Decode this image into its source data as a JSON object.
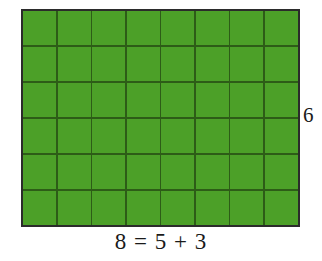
{
  "figure": {
    "title": "",
    "background_color": "#ffffff"
  },
  "grid": {
    "columns": 8,
    "rows": 6,
    "total_cells": 48,
    "fill_color": "#4ca028",
    "gridline_color": "#2d5c17",
    "border_color": "#2b2b2b"
  },
  "labels": {
    "height": "6",
    "equation": "8 = 5 + 3"
  },
  "chart_data": {
    "type": "table",
    "title": "",
    "subtitle": "",
    "xlabel": "8 = 5 + 3",
    "ylabel": "6",
    "columns": 8,
    "rows": 6,
    "area": 48,
    "decomposition": {
      "width_total": 8,
      "width_parts": [
        5,
        3
      ],
      "height": 6
    },
    "categories": [
      "c1",
      "c2",
      "c3",
      "c4",
      "c5",
      "c6",
      "c7",
      "c8"
    ],
    "values": [
      6,
      6,
      6,
      6,
      6,
      6,
      6,
      6
    ],
    "annotations": [
      "6",
      "8 = 5 + 3"
    ],
    "grid": true,
    "legend": "none"
  }
}
